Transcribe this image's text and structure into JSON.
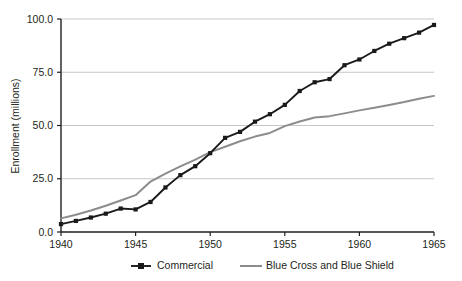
{
  "chart_data": {
    "type": "line",
    "title": "",
    "subtitle": "",
    "xlabel": "",
    "ylabel": "Enrollment (millions)",
    "xlim": [
      1940,
      1965
    ],
    "ylim": [
      0,
      100
    ],
    "grid": "horizontal",
    "legend_position": "bottom",
    "x": [
      1940,
      1941,
      1942,
      1943,
      1944,
      1945,
      1946,
      1947,
      1948,
      1949,
      1950,
      1951,
      1952,
      1953,
      1954,
      1955,
      1956,
      1957,
      1958,
      1959,
      1960,
      1961,
      1962,
      1963,
      1964,
      1965
    ],
    "x_tick_labels": [
      "1940",
      "1945",
      "1950",
      "1955",
      "1960",
      "1965"
    ],
    "x_ticks": [
      1940,
      1945,
      1950,
      1955,
      1960,
      1965
    ],
    "y_ticks": [
      0,
      25,
      50,
      75,
      100
    ],
    "y_tick_labels": [
      "0.0",
      "25.0",
      "50.0",
      "75.0",
      "100.0"
    ],
    "series": [
      {
        "name": "Commercial",
        "color": "#1a1a1a",
        "marker": "square",
        "values": [
          3.7,
          5.2,
          6.8,
          8.6,
          11.0,
          10.6,
          14.1,
          20.9,
          26.7,
          30.9,
          37.0,
          44.2,
          47.0,
          51.8,
          55.3,
          59.7,
          66.2,
          70.3,
          71.8,
          78.3,
          81.0,
          85.0,
          88.4,
          91.0,
          93.6,
          97.2
        ]
      },
      {
        "name": "Blue Cross and Blue Shield",
        "color": "#8c8c8c",
        "marker": "none",
        "values": [
          6.4,
          8.1,
          10.1,
          12.3,
          14.8,
          17.3,
          23.7,
          27.4,
          30.8,
          34.0,
          37.5,
          40.0,
          42.6,
          44.8,
          46.5,
          49.7,
          51.9,
          53.8,
          54.4,
          55.7,
          57.1,
          58.3,
          59.6,
          61.0,
          62.6,
          63.9
        ]
      }
    ],
    "annotations": []
  },
  "legend": {
    "items": [
      {
        "label": "Commercial"
      },
      {
        "label": "Blue Cross and Blue Shield"
      }
    ]
  }
}
